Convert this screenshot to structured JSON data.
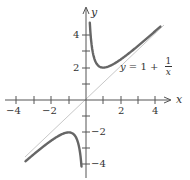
{
  "chart_data": {
    "type": "line",
    "title": "",
    "equation_label": {
      "lhs": "y",
      "op": "= 1 +",
      "num": "1",
      "den": "x"
    },
    "xlabel": "x",
    "ylabel": "y",
    "xlim": [
      -4.5,
      4.8
    ],
    "ylim": [
      -4.2,
      5.5
    ],
    "x_ticks": [
      -4,
      -3,
      -2,
      -1,
      1,
      2,
      3,
      4
    ],
    "x_tick_labels": [
      "-4",
      "-2",
      "2",
      "4"
    ],
    "y_ticks": [
      -4,
      -3,
      -2,
      -1,
      1,
      2,
      3,
      4
    ],
    "y_tick_labels": [
      "4",
      "2",
      "-2",
      "-4"
    ],
    "grid": false,
    "series": [
      {
        "name": "curve (x > 0)",
        "function": "x + 1/x",
        "x_range": [
          0.22,
          4.3
        ],
        "color": "#666666"
      },
      {
        "name": "curve (x < 0)",
        "function": "x + 1/x",
        "x_range": [
          -3.5,
          -0.26
        ],
        "color": "#666666"
      },
      {
        "name": "asymptote y = x",
        "function": "x",
        "x_range": [
          -3.5,
          4.5
        ],
        "color": "#bbbbbb"
      }
    ]
  },
  "labels": {
    "x_axis": "x",
    "y_axis": "y",
    "xticks": {
      "m4": "−4",
      "m2": "−2",
      "p2": "2",
      "p4": "4"
    },
    "yticks": {
      "p4": "4",
      "p2": "2",
      "m2": "−2",
      "m4": "−4"
    },
    "equation": {
      "lhs": "y",
      "mid": " = 1 + ",
      "num": "1",
      "den": "x"
    }
  }
}
